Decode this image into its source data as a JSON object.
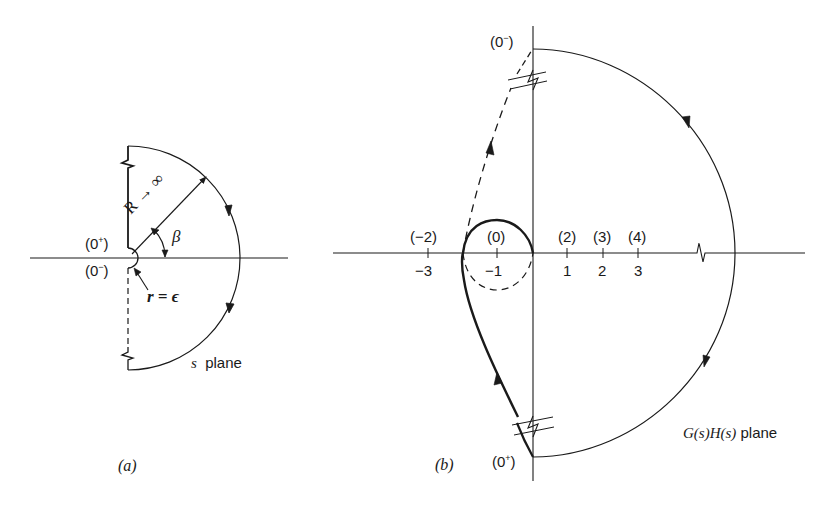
{
  "figure_a": {
    "caption": "(a)",
    "plane_label_var": "s",
    "plane_label_word": "plane",
    "upper_point": "(0+)",
    "upper_point_base": "(0",
    "upper_point_sup": "+",
    "lower_point_base": "(0",
    "lower_point_sup": "−",
    "close_paren": ")",
    "radius_label": "R → ∞",
    "angle_label": "β",
    "small_radius_label": "r = ϵ"
  },
  "figure_b": {
    "caption": "(b)",
    "plane_label_func": "G(s)H(s)",
    "plane_label_word": "plane",
    "top_point_base": "(0",
    "top_point_sup": "−",
    "bottom_point_base": "(0",
    "bottom_point_sup": "+",
    "close_paren": ")",
    "axis_ticks": [
      {
        "value": "−3",
        "bracket": "(−2)"
      },
      {
        "value": "−1",
        "bracket": "(0)"
      },
      {
        "value": "1",
        "bracket": "(2)"
      },
      {
        "value": "2",
        "bracket": "(3)"
      },
      {
        "value": "3",
        "bracket": "(4)"
      }
    ]
  },
  "colors": {
    "ink": "#1a1a1a",
    "background": "#ffffff"
  }
}
